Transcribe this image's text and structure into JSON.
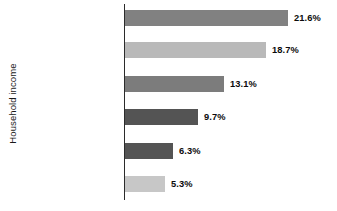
{
  "chart_data": {
    "type": "bar",
    "orientation": "horizontal",
    "title": "",
    "xlabel": "",
    "ylabel": "Household income",
    "grid": false,
    "legend": "none",
    "xlim": [
      0,
      21.6
    ],
    "categories": [
      "Less than $25,000",
      "$25,000 to $49,999",
      "$50,000 to $74,999",
      "$75,000 to $99,999",
      "$100,000 to $149,999",
      "$150,000 and over"
    ],
    "values": [
      21.6,
      18.7,
      13.1,
      9.7,
      6.3,
      5.3
    ],
    "value_labels": [
      "21.6%",
      "18.7%",
      "13.1%",
      "9.7%",
      "6.3%",
      "5.3%"
    ],
    "bar_colors": [
      "#818181",
      "#b9b9b9",
      "#7c7c7c",
      "#545454",
      "#545454",
      "#c7c7c7"
    ]
  },
  "axis": {
    "line_color": "#2b2b2b"
  }
}
